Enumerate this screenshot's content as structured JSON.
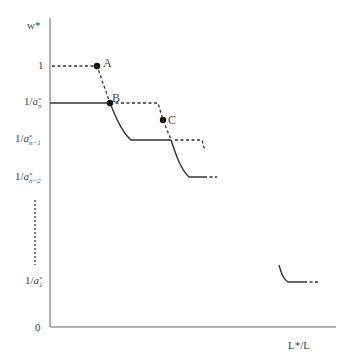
{
  "figure": {
    "y_axis_label": "w*",
    "x_axis_label": "L*/L",
    "origin_label": "0",
    "y_ticks": [
      {
        "id": "one",
        "label": "1"
      },
      {
        "id": "an",
        "prefix": "1/",
        "var": "a",
        "sup": "*",
        "sub": "n"
      },
      {
        "id": "an1",
        "prefix": "1/",
        "var": "a",
        "sup": "*",
        "sub": "n−1"
      },
      {
        "id": "an2",
        "prefix": "1/",
        "var": "a",
        "sup": "*",
        "sub": "n−2"
      },
      {
        "id": "a1",
        "prefix": "1/",
        "var": "a",
        "sup": "*",
        "sub": "1"
      }
    ],
    "points": [
      {
        "id": "A",
        "label": "A"
      },
      {
        "id": "B",
        "label": "B"
      },
      {
        "id": "C",
        "label": "C"
      }
    ],
    "colors": {
      "solid": "#333333",
      "dashed": "#333333",
      "axis": "#555555"
    }
  }
}
